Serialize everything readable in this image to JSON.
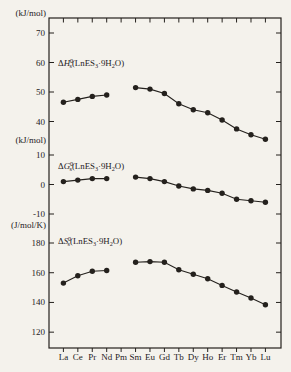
{
  "figure": {
    "background_color": "#f4f2ec",
    "ink_color": "#24211d",
    "marker": "filled-circle"
  },
  "chart_data": {
    "type": "line",
    "categories": [
      "La",
      "Ce",
      "Pr",
      "Nd",
      "Pm",
      "Sm",
      "Eu",
      "Gd",
      "Tb",
      "Dy",
      "Ho",
      "Er",
      "Tm",
      "Yb",
      "Lu"
    ],
    "missing_category": "Pm",
    "legend": "none",
    "grid": "off",
    "panels": [
      {
        "name": "standard-enthalpy",
        "unit": "(kJ/mol)",
        "label_text": "ΔH0s(LnES3·9H2O)",
        "label_parts": [
          {
            "t": "Δ",
            "k": "n"
          },
          {
            "t": "H",
            "k": "i"
          },
          {
            "t": "0",
            "k": "sup"
          },
          {
            "t": "s",
            "k": "stack"
          },
          {
            "t": "(LnES",
            "k": "n"
          },
          {
            "t": "3",
            "k": "sub"
          },
          {
            "t": "·9H",
            "k": "n"
          },
          {
            "t": "2",
            "k": "sub"
          },
          {
            "t": "O)",
            "k": "n"
          }
        ],
        "ticks": [
          70,
          60,
          50,
          40
        ],
        "ylim": [
          34,
          74
        ],
        "values": [
          46.5,
          47.5,
          48.5,
          49,
          null,
          51.5,
          51,
          49.5,
          46,
          44,
          43,
          40.5,
          37.5,
          35.5,
          34
        ]
      },
      {
        "name": "standard-gibbs-energy",
        "unit": "(kJ/mol)",
        "label_text": "ΔG0s(LnES3·9H2O)",
        "label_parts": [
          {
            "t": "Δ",
            "k": "n"
          },
          {
            "t": "G",
            "k": "i"
          },
          {
            "t": "0",
            "k": "sup"
          },
          {
            "t": "s",
            "k": "stack"
          },
          {
            "t": "(LnES",
            "k": "n"
          },
          {
            "t": "3",
            "k": "sub"
          },
          {
            "t": "·9H",
            "k": "n"
          },
          {
            "t": "2",
            "k": "sub"
          },
          {
            "t": "O)",
            "k": "n"
          }
        ],
        "ticks": [
          10,
          0,
          -10
        ],
        "ylim": [
          -13,
          12
        ],
        "values": [
          1,
          1.5,
          2,
          2,
          null,
          2.5,
          2,
          1,
          -0.5,
          -1.5,
          -2,
          -3,
          -5,
          -5.5,
          -6
        ]
      },
      {
        "name": "standard-entropy",
        "unit": "(J/mol/K)",
        "label_text": "ΔS0s(LnES3·9H2O)",
        "label_parts": [
          {
            "t": "Δ",
            "k": "n"
          },
          {
            "t": "S",
            "k": "i"
          },
          {
            "t": "0",
            "k": "sup"
          },
          {
            "t": "s",
            "k": "stack"
          },
          {
            "t": "(LnES",
            "k": "n"
          },
          {
            "t": "3",
            "k": "sub"
          },
          {
            "t": "·9H",
            "k": "n"
          },
          {
            "t": "2",
            "k": "sub"
          },
          {
            "t": "O)",
            "k": "n"
          }
        ],
        "ticks": [
          180,
          160,
          140,
          120
        ],
        "ylim": [
          117,
          184
        ],
        "values": [
          153,
          158,
          161,
          161.5,
          null,
          167,
          167.5,
          167,
          162,
          159,
          156,
          151.5,
          147,
          143,
          138.5
        ]
      }
    ]
  }
}
